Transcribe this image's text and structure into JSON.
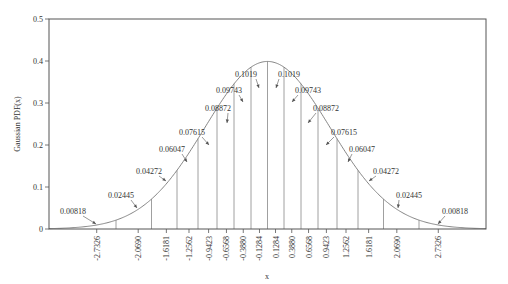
{
  "chart_data": {
    "type": "line",
    "title": "",
    "xlabel": "x",
    "ylabel": "Gaussian PDF(x)",
    "xlim": [
      -3.9,
      3.55
    ],
    "ylim": [
      0,
      0.5
    ],
    "grid": false,
    "legend": null,
    "y_ticks": [
      0,
      0.1,
      0.2,
      0.3,
      0.4,
      0.5
    ],
    "y_tick_labels": [
      "0",
      "0.1",
      "0.2",
      "0.3",
      "0.4",
      "0.5"
    ],
    "x_ticks": [
      -2.7326,
      -2.069,
      -1.6181,
      -1.2562,
      -0.9423,
      -0.6568,
      -0.388,
      -0.1284,
      0.1284,
      0.388,
      0.6568,
      0.9423,
      1.2562,
      1.6181,
      2.069,
      2.7326
    ],
    "x_tick_labels": [
      "-2.7326",
      "-2.0690",
      "-1.6181",
      "-1.2562",
      "-0.9423",
      "-0.6568",
      "-0.3880",
      "-0.1284",
      "0.1284",
      "0.3880",
      "0.6568",
      "0.9423",
      "1.2562",
      "1.6181",
      "2.0690",
      "2.7326"
    ],
    "curve": {
      "name": "Gaussian PDF",
      "mean": 0,
      "std": 1
    },
    "partition_boundaries": [
      -2.424,
      -1.856,
      -1.448,
      -1.112,
      -0.808,
      -0.536,
      -0.264,
      0,
      0.264,
      0.536,
      0.808,
      1.112,
      1.448,
      1.856,
      2.424
    ],
    "bin_probabilities": [
      {
        "x": -2.7326,
        "label": "0.00818"
      },
      {
        "x": -2.069,
        "label": "0.02445"
      },
      {
        "x": -1.6181,
        "label": "0.04272"
      },
      {
        "x": -1.2562,
        "label": "0.06047"
      },
      {
        "x": -0.9423,
        "label": "0.07615"
      },
      {
        "x": -0.6568,
        "label": "0.08872"
      },
      {
        "x": -0.388,
        "label": "0.09743"
      },
      {
        "x": -0.1284,
        "label": "0.1019"
      },
      {
        "x": 0.1284,
        "label": "0.1019"
      },
      {
        "x": 0.388,
        "label": "0.09743"
      },
      {
        "x": 0.6568,
        "label": "0.08872"
      },
      {
        "x": 0.9423,
        "label": "0.07615"
      },
      {
        "x": 1.2562,
        "label": "0.06047"
      },
      {
        "x": 1.6181,
        "label": "0.04272"
      },
      {
        "x": 2.069,
        "label": "0.02445"
      },
      {
        "x": 2.7326,
        "label": "0.00818"
      }
    ]
  },
  "layout": {
    "plot_left": 49,
    "plot_right": 486,
    "plot_top": 19,
    "plot_bottom": 229,
    "x_zero_px": 267.5,
    "x_px_per_unit": 62.5,
    "y_px_per_unit": 420
  },
  "colors": {
    "axis": "#555555",
    "curve": "#777777",
    "lines": "#888888",
    "text": "#333333"
  },
  "annotations": [
    {
      "label": "0.00818",
      "tx": 73,
      "ty": 214,
      "ax": 96,
      "ay": 224,
      "anchor": "middle"
    },
    {
      "label": "0.02445",
      "tx": 121,
      "ty": 198,
      "ax": 137,
      "ay": 208,
      "anchor": "middle"
    },
    {
      "label": "0.04272",
      "tx": 149,
      "ty": 174,
      "ax": 166,
      "ay": 181,
      "anchor": "middle"
    },
    {
      "label": "0.06047",
      "tx": 172,
      "ty": 152,
      "ax": 187,
      "ay": 162,
      "anchor": "middle"
    },
    {
      "label": "0.07615",
      "tx": 192,
      "ty": 135,
      "ax": 209,
      "ay": 145,
      "anchor": "middle"
    },
    {
      "label": "0.08872",
      "tx": 218,
      "ty": 111,
      "ax": 227,
      "ay": 123,
      "anchor": "middle"
    },
    {
      "label": "0.09743",
      "tx": 229,
      "ty": 93,
      "ax": 243,
      "ay": 102,
      "anchor": "middle"
    },
    {
      "label": "0.1019",
      "tx": 246,
      "ty": 77,
      "ax": 259,
      "ay": 88,
      "anchor": "middle"
    },
    {
      "label": "0.1019",
      "tx": 289,
      "ty": 77,
      "ax": 276,
      "ay": 88,
      "anchor": "middle"
    },
    {
      "label": "0.09743",
      "tx": 308,
      "ty": 93,
      "ax": 292,
      "ay": 102,
      "anchor": "middle"
    },
    {
      "label": "0.08872",
      "tx": 326,
      "ty": 111,
      "ax": 308,
      "ay": 123,
      "anchor": "middle"
    },
    {
      "label": "0.07615",
      "tx": 344,
      "ty": 135,
      "ax": 326,
      "ay": 145,
      "anchor": "middle"
    },
    {
      "label": "0.06047",
      "tx": 362,
      "ty": 152,
      "ax": 348,
      "ay": 162,
      "anchor": "middle"
    },
    {
      "label": "0.04272",
      "tx": 386,
      "ty": 174,
      "ax": 369,
      "ay": 181,
      "anchor": "middle"
    },
    {
      "label": "0.02445",
      "tx": 409,
      "ty": 198,
      "ax": 398,
      "ay": 208,
      "anchor": "middle"
    },
    {
      "label": "0.00818",
      "tx": 455,
      "ty": 214,
      "ax": 438,
      "ay": 224,
      "anchor": "middle"
    }
  ]
}
